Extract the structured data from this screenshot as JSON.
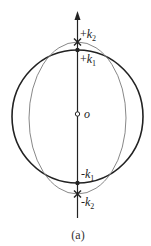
{
  "figure": {
    "caption": "(a)",
    "origin_label": "o",
    "points": {
      "plus_k2": {
        "sign": "+",
        "var": "k",
        "sub": "2"
      },
      "plus_k1": {
        "sign": "+",
        "var": "k",
        "sub": "1"
      },
      "minus_k1": {
        "sign": "-",
        "var": "k",
        "sub": "1"
      },
      "minus_k2": {
        "sign": "-",
        "var": "k",
        "sub": "2"
      }
    },
    "colors": {
      "circle": "#222222",
      "ellipse": "#888888",
      "axis": "#222222"
    }
  }
}
